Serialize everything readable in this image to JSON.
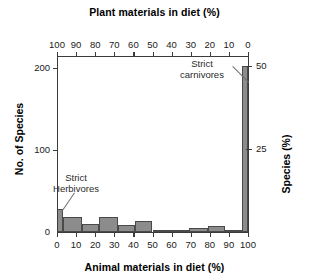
{
  "chart_data": {
    "type": "bar",
    "title": "",
    "top_axis_label": "Plant materials in diet (%)",
    "xlabel": "Animal materials in diet (%)",
    "ylabel": "No. of Species",
    "ylabel_right": "Species (%)",
    "xlim": [
      0,
      100
    ],
    "ylim": [
      0,
      215
    ],
    "grid": false,
    "legend": "none",
    "x_ticks": [
      "0",
      "10",
      "20",
      "30",
      "40",
      "50",
      "60",
      "70",
      "80",
      "90",
      "100"
    ],
    "top_ticks": [
      "100",
      "90",
      "80",
      "70",
      "60",
      "50",
      "40",
      "30",
      "20",
      "10",
      "0"
    ],
    "y_ticks": [
      "0",
      "100",
      "200"
    ],
    "y_ticks_right": [
      "25",
      "50"
    ],
    "categories": [
      "0",
      "0-10",
      "10-20",
      "20-30",
      "30-40",
      "40-50",
      "50-60",
      "60-70",
      "70-80",
      "80-90",
      "90-100",
      "100"
    ],
    "values": [
      28,
      18,
      10,
      18,
      9,
      13,
      2,
      3,
      5,
      7,
      3,
      203
    ],
    "bars": [
      {
        "label": "strict-herbivores",
        "x0": 0,
        "x1": 3,
        "value": 28,
        "percent": 6.9
      },
      {
        "label": "0-10",
        "x0": 3,
        "x1": 13,
        "value": 18,
        "percent": 4.4
      },
      {
        "label": "10-20",
        "x0": 13,
        "x1": 22,
        "value": 10,
        "percent": 2.5
      },
      {
        "label": "20-30",
        "x0": 22,
        "x1": 32,
        "value": 18,
        "percent": 4.4
      },
      {
        "label": "30-40",
        "x0": 32,
        "x1": 41,
        "value": 9,
        "percent": 2.2
      },
      {
        "label": "40-50",
        "x0": 41,
        "x1": 50,
        "value": 13,
        "percent": 3.2
      },
      {
        "label": "50-60",
        "x0": 50,
        "x1": 60,
        "value": 2,
        "percent": 0.5
      },
      {
        "label": "60-70",
        "x0": 60,
        "x1": 69,
        "value": 3,
        "percent": 0.7
      },
      {
        "label": "70-80",
        "x0": 69,
        "x1": 79,
        "value": 5,
        "percent": 1.2
      },
      {
        "label": "80-90",
        "x0": 79,
        "x1": 88,
        "value": 7,
        "percent": 1.7
      },
      {
        "label": "90-100",
        "x0": 88,
        "x1": 97,
        "value": 3,
        "percent": 0.7
      },
      {
        "label": "strict-carnivores",
        "x0": 97,
        "x1": 100,
        "value": 203,
        "percent": 50.0
      }
    ],
    "annotations": [
      {
        "name": "strict-carnivores",
        "line1": "Strict",
        "line2": "carnivores"
      },
      {
        "name": "strict-herbivores",
        "line1": "Strict",
        "line2": "Herbivores"
      }
    ],
    "colors": {
      "bar_fill": "#8c8c8c",
      "bar_edge": "#4a4a4a",
      "axis": "#3b3b3b",
      "text": "#000000",
      "annotation_text": "#2b2b2b",
      "background": "#ffffff"
    }
  }
}
